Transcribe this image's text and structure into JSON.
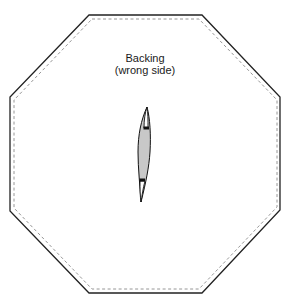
{
  "diagram": {
    "title_line_1": "Backing",
    "title_line_2": "(wrong side)",
    "shape": "octagon",
    "outer_outline": {
      "style": "solid",
      "color": "#222222",
      "points": [
        [
          89,
          15
        ],
        [
          202,
          15
        ],
        [
          280,
          97
        ],
        [
          280,
          210
        ],
        [
          202,
          293
        ],
        [
          89,
          293
        ],
        [
          10,
          211
        ],
        [
          10,
          97
        ]
      ]
    },
    "seam_line": {
      "style": "dashed",
      "color": "#8a8a8a",
      "points": [
        [
          92,
          19
        ],
        [
          199,
          19
        ],
        [
          277,
          100
        ],
        [
          277,
          207
        ],
        [
          199,
          289
        ],
        [
          92,
          289
        ],
        [
          14,
          208
        ],
        [
          14,
          100
        ]
      ]
    },
    "slit": {
      "description": "curved opening slit in backing",
      "fill_color": "#c8c8c8",
      "stroke_color": "#111111"
    }
  }
}
